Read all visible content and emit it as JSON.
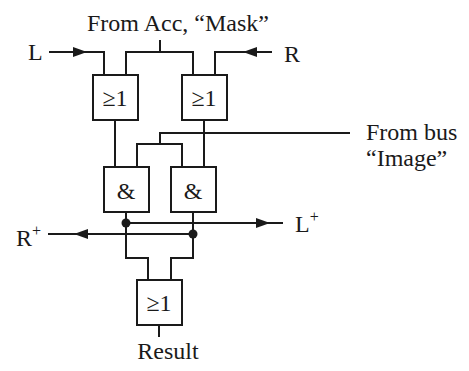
{
  "diagram": {
    "title": "From Acc, “Mask”",
    "inputs": {
      "left": "L",
      "right": "R",
      "bus_line1": "From bus",
      "bus_line2": "“Image”"
    },
    "outputs": {
      "left_plus": "L",
      "right_plus": "R",
      "plus_sup": "+",
      "result": "Result"
    },
    "gates": {
      "or_top_left": "≥1",
      "or_top_right": "≥1",
      "and_left": "&",
      "and_right": "&",
      "or_bottom": "≥1"
    },
    "colors": {
      "line": "#1a1a1a",
      "background": "#ffffff"
    }
  }
}
